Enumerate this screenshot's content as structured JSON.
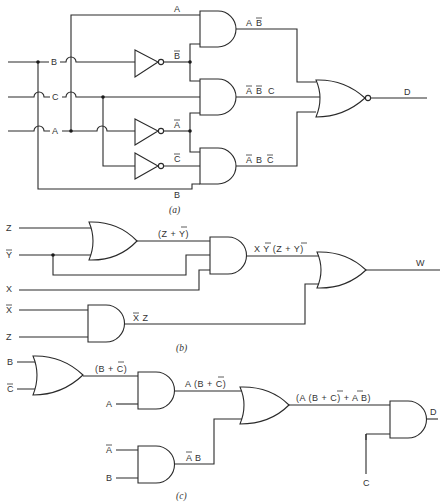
{
  "figure_a": {
    "caption": "(a)",
    "inputs": {
      "b": "B",
      "c": "C",
      "a": "A"
    },
    "wire_labels": {
      "a_top": "A",
      "b_bar": "B",
      "a_bar": "A",
      "c_bar": "C",
      "b_bottom": "B"
    },
    "terms": {
      "t1_a": "A",
      "t1_b": "B",
      "t2_a": "A",
      "t2_b": "B",
      "t2_c": "C",
      "t3_a": "A",
      "t3_b": "B",
      "t3_c": "C"
    },
    "output": "D"
  },
  "figure_b": {
    "caption": "(b)",
    "inputs": {
      "z1": "Z",
      "ybar": "Y",
      "x": "X",
      "xbar": "X",
      "z2": "Z"
    },
    "or1_out": "(Z + Y)",
    "and1_out": "X Y (Z + Y)",
    "and2_out": "X Z",
    "output": "W"
  },
  "figure_c": {
    "caption": "(c)",
    "inputs": {
      "b1": "B",
      "cbar": "C",
      "a1": "A",
      "abar": "A",
      "b2": "B",
      "c": "C"
    },
    "or1_out": "(B + C)",
    "and1_out": "A (B + C)",
    "and2_out": "A B",
    "or2_out": "(A (B + C) + A B)",
    "output": "D"
  }
}
